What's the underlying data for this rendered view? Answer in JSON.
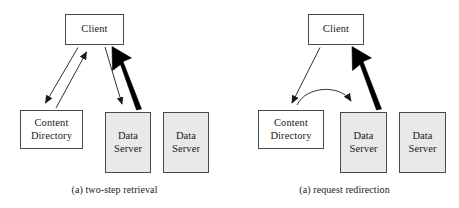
{
  "figure": {
    "background_color": "#ffffff",
    "stroke_color": "#4a4a4a",
    "shaded_fill": "#e9e9e9",
    "emphasis_color": "#000000"
  },
  "panels": [
    {
      "id": "two-step-retrieval",
      "caption": "(a) two-step retrieval",
      "nodes": {
        "client": "Client",
        "directory_line1": "Content",
        "directory_line2": "Directory",
        "server1_line1": "Data",
        "server1_line2": "Server",
        "server2_line1": "Data",
        "server2_line2": "Server"
      },
      "edges": [
        {
          "name": "client-to-directory",
          "from": "Client",
          "to": "Content Directory",
          "style": "thin",
          "direction": "down"
        },
        {
          "name": "directory-to-client",
          "from": "Content Directory",
          "to": "Client",
          "style": "thin",
          "direction": "up"
        },
        {
          "name": "client-to-data-server",
          "from": "Client",
          "to": "Data Server",
          "style": "thin",
          "direction": "down"
        },
        {
          "name": "data-server-to-client",
          "from": "Data Server",
          "to": "Client",
          "style": "thick",
          "direction": "up"
        }
      ]
    },
    {
      "id": "request-redirection",
      "caption": "(a) request redirection",
      "nodes": {
        "client": "Client",
        "directory_line1": "Content",
        "directory_line2": "Directory",
        "server1_line1": "Data",
        "server1_line2": "Server",
        "server2_line1": "Data",
        "server2_line2": "Server"
      },
      "edges": [
        {
          "name": "client-to-directory",
          "from": "Client",
          "to": "Content Directory",
          "style": "thin",
          "direction": "down"
        },
        {
          "name": "directory-redirect-to-data-server",
          "from": "Content Directory",
          "to": "Data Server",
          "style": "curved",
          "direction": "right"
        },
        {
          "name": "data-server-to-client",
          "from": "Data Server",
          "to": "Client",
          "style": "thick",
          "direction": "up"
        }
      ]
    }
  ]
}
